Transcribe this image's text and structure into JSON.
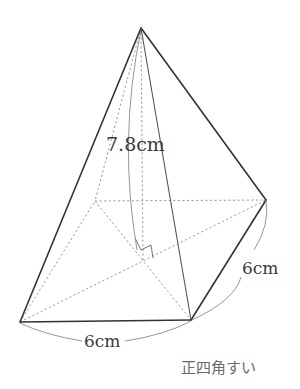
{
  "figure": {
    "title": "正四角すい",
    "labels": {
      "height": "7.8cm",
      "base_front": "6cm",
      "base_side": "6cm"
    },
    "colors": {
      "edge": "#333333",
      "hidden_edge": "#9a9a9a",
      "text": "#3a3a3a",
      "caption": "#6a6a6a",
      "background": "#ffffff"
    }
  }
}
